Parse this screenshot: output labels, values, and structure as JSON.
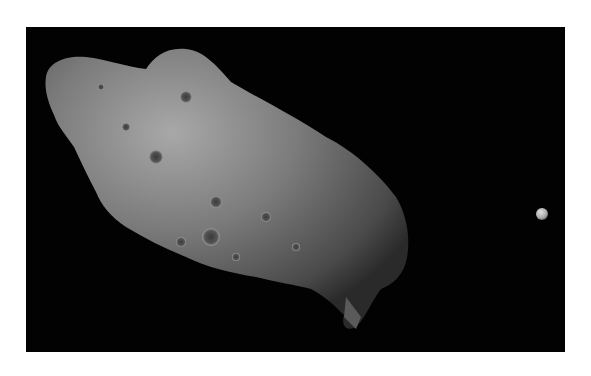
{
  "image": {
    "subject": "asteroid-with-small-moon",
    "background_color": "#020202",
    "page_color": "#ffffff",
    "asteroid_color": "#7a7a7a",
    "moon_color": "#bdbdbd"
  }
}
